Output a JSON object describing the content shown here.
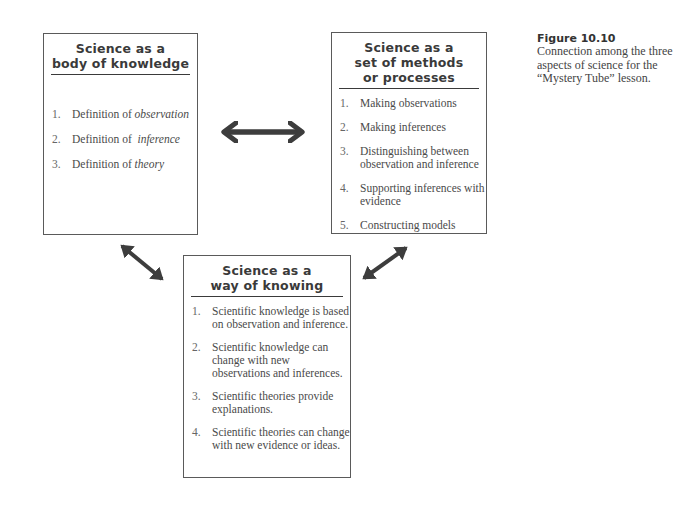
{
  "figure": {
    "label": "Figure 10.10",
    "caption": "Connection among the three aspects of science for the “Mystery Tube” lesson."
  },
  "boxes": {
    "knowledge": {
      "title_lines": [
        "Science as a",
        "body of knowledge"
      ],
      "items": [
        {
          "num": "1.",
          "text": "Definition of ",
          "em": "observation"
        },
        {
          "num": "2.",
          "text": "Definition of  ",
          "em": "inference"
        },
        {
          "num": "3.",
          "text": "Definition of ",
          "em": "theory"
        }
      ]
    },
    "methods": {
      "title_lines": [
        "Science as a",
        "set of methods",
        "or processes"
      ],
      "items": [
        {
          "num": "1.",
          "text": "Making observations"
        },
        {
          "num": "2.",
          "text": "Making inferences"
        },
        {
          "num": "3.",
          "text": "Distinguishing between observation and inference"
        },
        {
          "num": "4.",
          "text": "Supporting inferences with evidence"
        },
        {
          "num": "5.",
          "text": "Constructing models"
        }
      ]
    },
    "knowing": {
      "title_lines": [
        "Science as a",
        "way of knowing"
      ],
      "items": [
        {
          "num": "1.",
          "text": "Scientific knowledge is based on observation and inference."
        },
        {
          "num": "2.",
          "text": "Scientific knowledge can change with new observations and inferences."
        },
        {
          "num": "3.",
          "text": "Scientific theories provide explanations."
        },
        {
          "num": "4.",
          "text": "Scientific theories can change with new evidence or ideas."
        }
      ]
    }
  },
  "arrows": [
    {
      "name": "knowledge-methods",
      "type": "double",
      "from": [
        218,
        132
      ],
      "to": [
        308,
        132
      ]
    },
    {
      "name": "knowledge-knowing",
      "type": "double",
      "from": [
        116,
        241
      ],
      "to": [
        168,
        284
      ]
    },
    {
      "name": "methods-knowing",
      "type": "double",
      "from": [
        412,
        244
      ],
      "to": [
        358,
        282
      ]
    }
  ],
  "colors": {
    "arrow": "#3d3d3d",
    "border": "#5a5a5a",
    "text": "#4a4a4a"
  }
}
